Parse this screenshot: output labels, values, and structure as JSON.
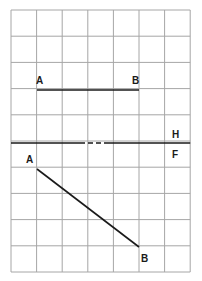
{
  "diagram": {
    "grid": {
      "x0": 11,
      "y0": 10,
      "cols": 7,
      "rows": 10,
      "col_w": 25.6,
      "row_h": 26.2,
      "color": "#a6a6a6"
    },
    "fold_line": {
      "y": 143,
      "label_top": "H",
      "label_bottom": "F",
      "dash_start": 80,
      "dash_end": 106
    },
    "top_view": {
      "start_label": "A",
      "end_label": "B",
      "x1": 37,
      "y1": 90,
      "x2": 139,
      "y2": 90
    },
    "front_view": {
      "start_label": "A",
      "end_label": "B",
      "x1": 37,
      "y1": 169,
      "x2": 139,
      "y2": 247
    },
    "line_color": "#1a1a1a"
  }
}
